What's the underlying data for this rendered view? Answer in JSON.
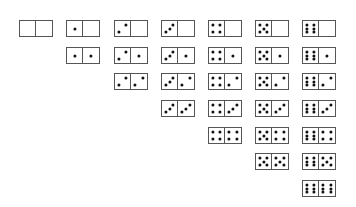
{
  "colors": {
    "border": "#555555",
    "pip": "#111111",
    "background": "#ffffff"
  },
  "layout": {
    "col_x": [
      19,
      66,
      114,
      161,
      208,
      255,
      302
    ],
    "row_y": [
      20,
      47,
      73,
      100,
      127,
      153,
      180
    ],
    "tile_w": 34,
    "tile_h": 17
  },
  "tiles": [
    {
      "left": 0,
      "right": 0
    },
    {
      "left": 1,
      "right": 0
    },
    {
      "left": 1,
      "right": 1
    },
    {
      "left": 2,
      "right": 0
    },
    {
      "left": 2,
      "right": 1
    },
    {
      "left": 2,
      "right": 2
    },
    {
      "left": 3,
      "right": 0
    },
    {
      "left": 3,
      "right": 1
    },
    {
      "left": 3,
      "right": 2
    },
    {
      "left": 3,
      "right": 3
    },
    {
      "left": 4,
      "right": 0
    },
    {
      "left": 4,
      "right": 1
    },
    {
      "left": 4,
      "right": 2
    },
    {
      "left": 4,
      "right": 3
    },
    {
      "left": 4,
      "right": 4
    },
    {
      "left": 5,
      "right": 0
    },
    {
      "left": 5,
      "right": 1
    },
    {
      "left": 5,
      "right": 2
    },
    {
      "left": 5,
      "right": 3
    },
    {
      "left": 5,
      "right": 4
    },
    {
      "left": 5,
      "right": 5
    },
    {
      "left": 6,
      "right": 0
    },
    {
      "left": 6,
      "right": 1
    },
    {
      "left": 6,
      "right": 2
    },
    {
      "left": 6,
      "right": 3
    },
    {
      "left": 6,
      "right": 4
    },
    {
      "left": 6,
      "right": 5
    },
    {
      "left": 6,
      "right": 6
    }
  ]
}
